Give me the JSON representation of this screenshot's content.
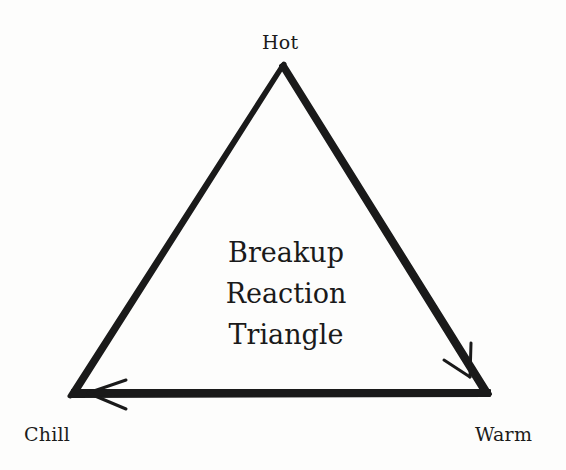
{
  "diagram": {
    "title_lines": [
      "Breakup",
      "Reaction",
      "Triangle"
    ],
    "vertices": {
      "top": {
        "label": "Hot"
      },
      "bottom_left": {
        "label": "Chill"
      },
      "bottom_right": {
        "label": "Warm"
      }
    },
    "edges": [
      {
        "from": "Hot",
        "to": "Warm",
        "arrow": "end"
      },
      {
        "from": "Warm",
        "to": "Chill",
        "arrow": "end"
      },
      {
        "from": "Chill",
        "to": "Hot",
        "arrow": "none"
      }
    ],
    "stroke_color": "#1a1a1a",
    "background_color": "#fdfdfc"
  }
}
